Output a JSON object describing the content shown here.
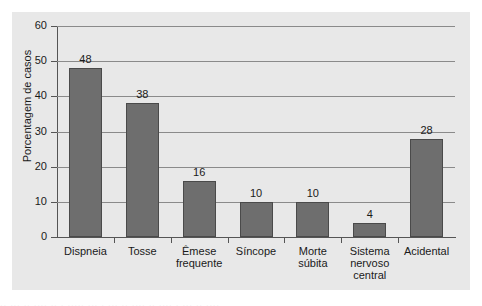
{
  "chart_data": {
    "type": "bar",
    "title": "",
    "xlabel": "",
    "ylabel": "Porcentagem de casos",
    "ylim": [
      0,
      60
    ],
    "yticks": [
      0,
      10,
      20,
      30,
      40,
      50,
      60
    ],
    "grid": true,
    "legend": null,
    "categories": [
      "Dispneia",
      "Tosse",
      "Êmese frequente",
      "Síncope",
      "Morte súbita",
      "Sistema nervoso central",
      "Acidental"
    ],
    "category_lines": [
      [
        "Dispneia"
      ],
      [
        "Tosse"
      ],
      [
        "Êmese",
        "frequente"
      ],
      [
        "Síncope"
      ],
      [
        "Morte",
        "súbita"
      ],
      [
        "Sistema",
        "nervoso",
        "central"
      ],
      [
        "Acidental"
      ]
    ],
    "values": [
      48,
      38,
      16,
      10,
      10,
      4,
      28
    ],
    "value_labels": [
      "48",
      "38",
      "16",
      "10",
      "10",
      "4",
      "28"
    ],
    "bar_color": "#6e6e6e",
    "panel_color": "#e8e8e8",
    "grid_color": "#8a8a8a",
    "axis_color": "#555555"
  }
}
